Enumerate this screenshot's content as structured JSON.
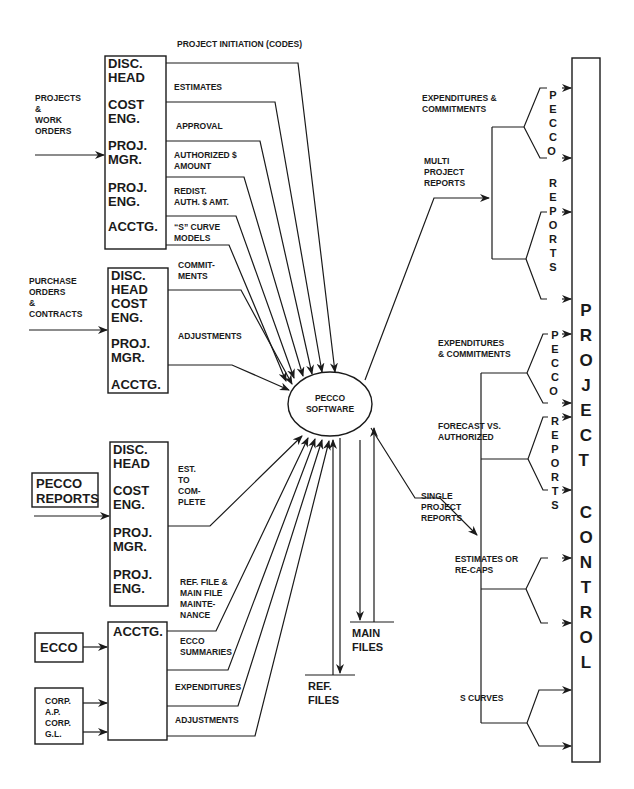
{
  "diagram": {
    "center": {
      "label_line1": "PECCO",
      "label_line2": "SOFTWARE"
    },
    "inputs": {
      "projects_work_orders": [
        "PROJECTS",
        "&",
        "WORK",
        "ORDERS"
      ],
      "purchase_orders": [
        "PURCHASE",
        "ORDERS",
        "&",
        "CONTRACTS"
      ],
      "pecco_reports": [
        "PECCO",
        "REPORTS"
      ],
      "ecco": "ECCO",
      "corp": [
        "CORP.",
        "A.P.",
        "CORP.",
        "G.L."
      ]
    },
    "box1": {
      "roles": [
        [
          "DISC.",
          "HEAD"
        ],
        [
          "COST",
          "ENG."
        ],
        [
          "PROJ.",
          "MGR."
        ],
        [
          "PROJ.",
          "ENG."
        ],
        [
          "ACCTG."
        ]
      ],
      "flows": {
        "f1": [
          "PROJECT INITIATION (CODES)"
        ],
        "f2": [
          "ESTIMATES"
        ],
        "f3": [
          "APPROVAL"
        ],
        "f4": [
          "AUTHORIZED $",
          "AMOUNT"
        ],
        "f5": [
          "REDIST.",
          "AUTH. $ AMT."
        ],
        "f6": [
          "“S” CURVE",
          "MODELS"
        ]
      }
    },
    "box2": {
      "roles": [
        "DISC.",
        "HEAD",
        "COST",
        "ENG.",
        "PROJ.",
        "MGR.",
        "ACCTG."
      ],
      "flows": {
        "f1": [
          "COMMIT-",
          "MENTS"
        ],
        "f2": [
          "ADJUSTMENTS"
        ]
      }
    },
    "box3": {
      "roles": [
        [
          "DISC.",
          "HEAD"
        ],
        [
          "COST",
          "ENG."
        ],
        [
          "PROJ.",
          "MGR."
        ],
        [
          "PROJ.",
          "ENG."
        ]
      ],
      "flows": {
        "f1": [
          "EST.",
          "TO",
          "COM-",
          "PLETE"
        ],
        "f2": [
          "REF. FILE &",
          "MAIN FILE",
          "MAINTE-",
          "NANCE"
        ]
      }
    },
    "box4": {
      "roles": [
        "ACCTG."
      ],
      "flows": {
        "f1": [
          "ECCO",
          "SUMMARIES"
        ],
        "f2": [
          "EXPENDITURES"
        ],
        "f3": [
          "ADJUSTMENTS"
        ]
      }
    },
    "files": {
      "main": [
        "MAIN",
        "FILES"
      ],
      "ref": [
        "REF.",
        "FILES"
      ]
    },
    "outputs": {
      "multi": {
        "label": [
          "MULTI",
          "PROJECT",
          "REPORTS"
        ],
        "exp_commit": [
          "EXPENDITURES &",
          "COMMITMENTS"
        ],
        "vertical": "PECCO REPORTS"
      },
      "single": {
        "label": [
          "SINGLE",
          "PROJECT",
          "REPORTS"
        ],
        "exp_commit": [
          "EXPENDITURES",
          "& COMMITMENTS"
        ],
        "forecast": [
          "FORECAST VS.",
          "AUTHORIZED"
        ],
        "estimates": [
          "ESTIMATES OR",
          "RE-CAPS"
        ],
        "s_curves": [
          "S CURVES"
        ],
        "vertical": "PECCO REPORTS"
      }
    },
    "project_control": "PROJECT CONTROL"
  }
}
